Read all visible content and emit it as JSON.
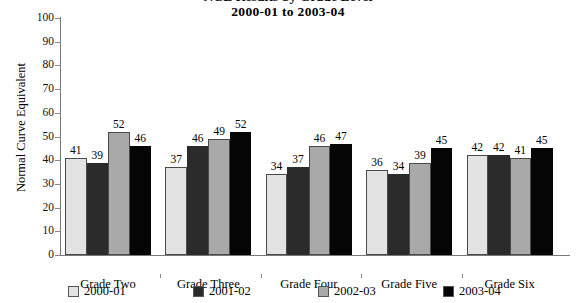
{
  "chart_data": {
    "type": "bar",
    "title": "NCE Results by Grade Level",
    "subtitle": "2000-01 to 2003-04",
    "xlabel": "",
    "ylabel": "Normal Curve Equivalent",
    "ylim": [
      0,
      100
    ],
    "ytick_step": 10,
    "yticks": [
      "100",
      "90",
      "80",
      "70",
      "60",
      "50",
      "40",
      "30",
      "20",
      "10",
      "0"
    ],
    "grid": false,
    "legend_position": "bottom",
    "categories": [
      "Grade Two",
      "Grade Three",
      "Grade Four",
      "Grade Five",
      "Grade Six"
    ],
    "series": [
      {
        "name": "2000-01",
        "color": "#e3e3e3",
        "values": [
          41,
          37,
          34,
          36,
          42
        ]
      },
      {
        "name": "2001-02",
        "color": "#2b2b2b",
        "values": [
          39,
          46,
          37,
          34,
          42
        ]
      },
      {
        "name": "2002-03",
        "color": "#a9a9a9",
        "values": [
          52,
          49,
          46,
          39,
          41
        ]
      },
      {
        "name": "2003-04",
        "color": "#050505",
        "values": [
          46,
          52,
          47,
          45,
          45
        ]
      }
    ]
  }
}
